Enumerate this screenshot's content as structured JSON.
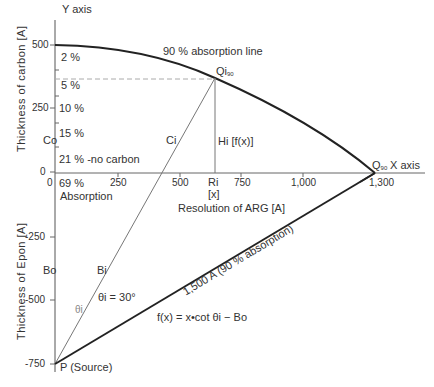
{
  "axes": {
    "y_axis_label": "Y axis",
    "x_axis_label": "X axis",
    "y_upper_title": "Thickness of carbon [A]",
    "y_lower_title": "Thickness of Epon [A]",
    "x_title": "Resolution of ARG [A]",
    "y_ticks": [
      "500",
      "250",
      "0",
      "-250",
      "-500",
      "-750"
    ],
    "x_ticks": [
      "0",
      "250",
      "500",
      "750",
      "1,000",
      "1,300"
    ]
  },
  "absorption_labels": [
    "2 %",
    "5 %",
    "10 %",
    "15 %",
    "21 % -no carbon",
    "69 %"
  ],
  "absorption_caption": "Absorption",
  "curve_label": "90 % absorption line",
  "points": {
    "qi": "Qi",
    "qi_sub": "90",
    "q90": "Q",
    "q90_sub": "90",
    "ri": "Ri",
    "ri_x": "[x]",
    "p": "P (Source)",
    "co": "Co",
    "bo": "Bo",
    "ci": "Ci",
    "bi": "Bi",
    "hi": "Hi [f(x)]"
  },
  "angle_label": "θi = 30°",
  "angle_small": "θi",
  "slant_label": "1,500 A (90 % absorption)",
  "formula": "f(x) = x•cot θi − Bo",
  "colors": {
    "line": "#222222",
    "thin": "#666666",
    "dashed": "#999999"
  }
}
